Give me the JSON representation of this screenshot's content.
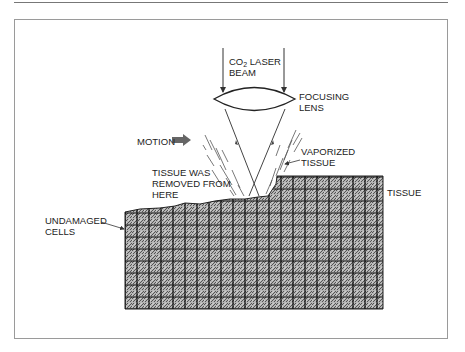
{
  "diagram": {
    "labels": {
      "beam_line1_prefix": "CO",
      "beam_line1_sub": "2",
      "beam_line1_suffix": " LASER",
      "beam_line2": "BEAM",
      "lens_line1": "FOCUSING",
      "lens_line2": "LENS",
      "motion": "MOTION",
      "vaporized_line1": "VAPORIZED",
      "vaporized_line2": "TISSUE",
      "removed_line1": "TISSUE WAS",
      "removed_line2": "REMOVED FROM",
      "removed_line3": "HERE",
      "tissue": "TISSUE",
      "undamaged_line1": "UNDAMAGED",
      "undamaged_line2": "CELLS"
    },
    "colors": {
      "line": "#333333",
      "frame": "#9a9a9a",
      "tissue_fill": "#9c9c9c",
      "grid": "#111111",
      "arrow": "#666666"
    },
    "tissue_grid": {
      "cell_size": 12,
      "left": 125,
      "right": 383,
      "bottom": 309
    }
  }
}
